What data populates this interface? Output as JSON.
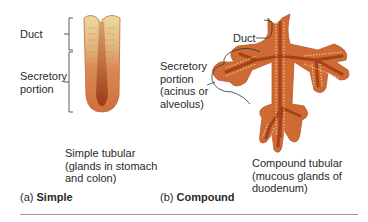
{
  "figure": {
    "panels": [
      {
        "id": "a",
        "part_prefix": "(a)",
        "part_title": "Simple",
        "labels": {
          "duct": "Duct",
          "secretory_line1": "Secretory",
          "secretory_line2": "portion"
        },
        "caption_lines": [
          "Simple tubular",
          "(glands in stomach",
          "and colon)"
        ]
      },
      {
        "id": "b",
        "part_prefix": "(b)",
        "part_title": "Compound",
        "labels": {
          "duct": "Duct",
          "secretory_line1": "Secretory",
          "secretory_line2": "portion",
          "secretory_line3": "(acinus or",
          "secretory_line4": "alveolus)"
        },
        "caption_lines": [
          "Compound tubular",
          "(mucous glands of",
          "duodenum)"
        ]
      }
    ],
    "colors": {
      "tissue_outer": "#d4733a",
      "tissue_dark": "#a8401a",
      "duct_epithelium": "#e8d89a",
      "cell_dots": "#e9d48c",
      "leader_lines": "#333333",
      "rule": "#9a9a9a"
    }
  }
}
